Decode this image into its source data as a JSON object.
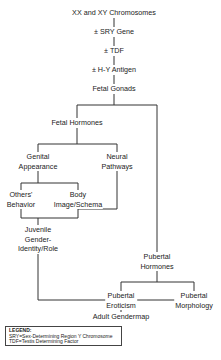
{
  "diagram": {
    "nodes": {
      "chromosomes": "XX and XY Chromosomes",
      "sry": "± SRY Gene",
      "tdf": "± TDF",
      "hy": "± H-Y Antigen",
      "gonads": "Fetal Gonads",
      "fetal_hormones": "Fetal Hormones",
      "genital_1": "Genital",
      "genital_2": "Appearance",
      "neural_1": "Neural",
      "neural_2": "Pathways",
      "others_1": "Others'",
      "others_2": "Behavior",
      "body_1": "Body",
      "body_2": "Image/Schema",
      "juvenile_1": "Juvenile",
      "juvenile_2": "Gender-",
      "juvenile_3": "Identity/Role",
      "pub_horm_1": "Pubertal",
      "pub_horm_2": "Hormones",
      "pub_erot_1": "Pubertal",
      "pub_erot_2": "Eroticism",
      "pub_morph_1": "Pubertal",
      "pub_morph_2": "Morphology",
      "adult": "Adult Gendermap"
    },
    "legend": {
      "title": "LEGEND:",
      "line1": "SRY=Sex-Determining Region Y Chromosome",
      "line2": "TDF=Testis Determining Factor"
    }
  }
}
